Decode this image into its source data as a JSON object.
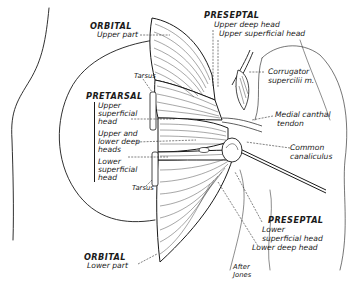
{
  "figure": {
    "credit": [
      "After",
      "Jones"
    ]
  },
  "labels": {
    "orbital_upper": {
      "title": "ORBITAL",
      "sub": "Upper part"
    },
    "tarsus_upper": "Tarsus",
    "pretarsal": {
      "title": "PRETARSAL",
      "upper_superficial": [
        "Upper",
        "superficial",
        "head"
      ],
      "upper_lower_deep": [
        "Upper and",
        "lower deep",
        "heads"
      ],
      "lower_superficial": [
        "Lower",
        "superficial",
        "head"
      ]
    },
    "tarsus_lower": "Tarsus",
    "orbital_lower": {
      "title": "ORBITAL",
      "sub": "Lower part"
    },
    "preseptal_upper": {
      "title": "PRESEPTAL",
      "deep": "Upper deep head",
      "superficial": "Upper superficial head"
    },
    "corrugator": [
      "Corrugator",
      "supercilii m."
    ],
    "medial_canthal": [
      "Medial canthal",
      "tendon"
    ],
    "canaliculus": [
      "Common",
      "canaliculus"
    ],
    "preseptal_lower": {
      "title": "PRESEPTAL",
      "superficial": [
        "Lower",
        "superficial head"
      ],
      "deep": "Lower deep head"
    }
  },
  "colors": {
    "ink": "#1a1a1a",
    "background": "#ffffff"
  }
}
